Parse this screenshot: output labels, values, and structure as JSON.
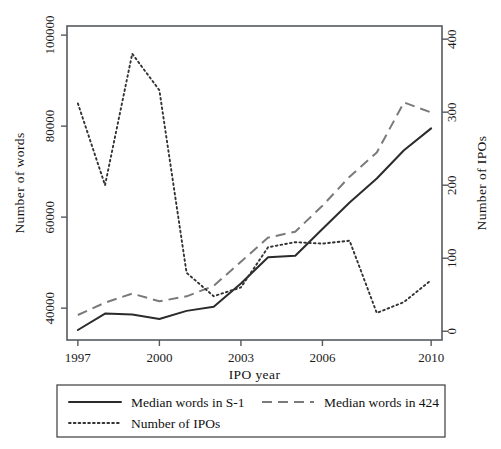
{
  "chart_data": {
    "type": "line",
    "title": "",
    "xlabel": "IPO year",
    "ylabel": "Number of words",
    "y2label": "Number of IPOs",
    "grid": false,
    "legend_position": "bottom",
    "x": [
      1997,
      1998,
      1999,
      2000,
      2001,
      2002,
      2003,
      2004,
      2005,
      2006,
      2007,
      2008,
      2009,
      2010
    ],
    "xlim": [
      1996.6,
      2010.4
    ],
    "ylim": [
      33000,
      102000
    ],
    "y2lim": [
      -12,
      418
    ],
    "xticks": [
      "1997",
      "2000",
      "2003",
      "2006",
      "2010"
    ],
    "xtick_values": [
      1997,
      2000,
      2003,
      2006,
      2010
    ],
    "yticks": [
      "40000",
      "60000",
      "80000",
      "100000"
    ],
    "ytick_values": [
      40000,
      60000,
      80000,
      100000
    ],
    "y2ticks": [
      "0",
      "100",
      "200",
      "300",
      "400"
    ],
    "y2tick_values": [
      0,
      100,
      200,
      300,
      400
    ],
    "series": [
      {
        "name": "Median words in S-1",
        "axis": "left",
        "style": "solid",
        "color": "#2b2b2b",
        "values": [
          35200,
          38800,
          38600,
          37600,
          39400,
          40300,
          45400,
          51200,
          51500,
          57400,
          63200,
          68500,
          74700,
          79500
        ]
      },
      {
        "name": "Median words in 424",
        "axis": "left",
        "style": "dashed",
        "color": "#7a7a7a",
        "values": [
          38500,
          41200,
          43200,
          41500,
          42600,
          44900,
          50200,
          55500,
          56800,
          62500,
          68900,
          74200,
          85200,
          83000
        ]
      },
      {
        "name": "Number of IPOs",
        "axis": "right",
        "style": "dotted",
        "color": "#333333",
        "values": [
          312,
          200,
          380,
          330,
          80,
          48,
          60,
          115,
          122,
          120,
          124,
          25,
          40,
          70
        ]
      }
    ]
  },
  "legend": {
    "entries": [
      {
        "label": "Median words in S-1",
        "style": "solid"
      },
      {
        "label": "Median words in 424",
        "style": "dashed"
      },
      {
        "label": "Number of IPOs",
        "style": "dotted"
      }
    ]
  }
}
